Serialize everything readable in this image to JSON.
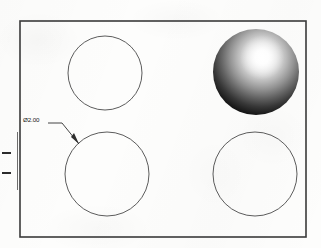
{
  "drawing": {
    "title": "Plate with four holes",
    "frame": {
      "name": "outer-border",
      "x": 20,
      "y": 21,
      "width": 286,
      "height": 216,
      "stroke": "#3a3a3a",
      "stroke_width": 1.6
    },
    "background_color": "#fdfdfc",
    "line_color": "#3a3a3a",
    "holes": [
      {
        "id": "hole-top-left",
        "label": "top-left hole",
        "cx": 105,
        "cy": 73,
        "r": 37,
        "style": "outline"
      },
      {
        "id": "hole-top-right",
        "label": "top-right sphere",
        "cx": 256,
        "cy": 72,
        "r": 43,
        "style": "shaded-sphere"
      },
      {
        "id": "hole-bottom-left",
        "label": "bottom-left hole",
        "cx": 107,
        "cy": 174,
        "r": 42,
        "style": "outline"
      },
      {
        "id": "hole-bottom-right",
        "label": "bottom-right hole",
        "cx": 255,
        "cy": 174,
        "r": 42,
        "style": "outline"
      }
    ],
    "sphere_shading": {
      "highlight_x": 262,
      "highlight_y": 58,
      "highlight_color": "#ffffff",
      "mid_color": "#8a8a8a",
      "edge_color": "#0d0d0d"
    },
    "dimension": {
      "name": "diameter-callout",
      "text": "Ø2.00",
      "symbol": "Ø",
      "value": "2.00",
      "text_x": 23,
      "text_y": 120,
      "leader": {
        "start_x": 48,
        "start_y": 123,
        "bend_x": 62,
        "bend_y": 123,
        "tip_x": 79,
        "tip_y": 144
      }
    },
    "edge_ticks": [
      {
        "name": "edge-tick-upper",
        "x": 2,
        "y": 152,
        "width": 9,
        "height": 2
      },
      {
        "name": "edge-tick-lower",
        "x": 2,
        "y": 172,
        "width": 9,
        "height": 2
      }
    ],
    "edge_rule": {
      "name": "left-edge-rule",
      "x": 17,
      "y": 132,
      "width": 1,
      "height": 58
    }
  }
}
